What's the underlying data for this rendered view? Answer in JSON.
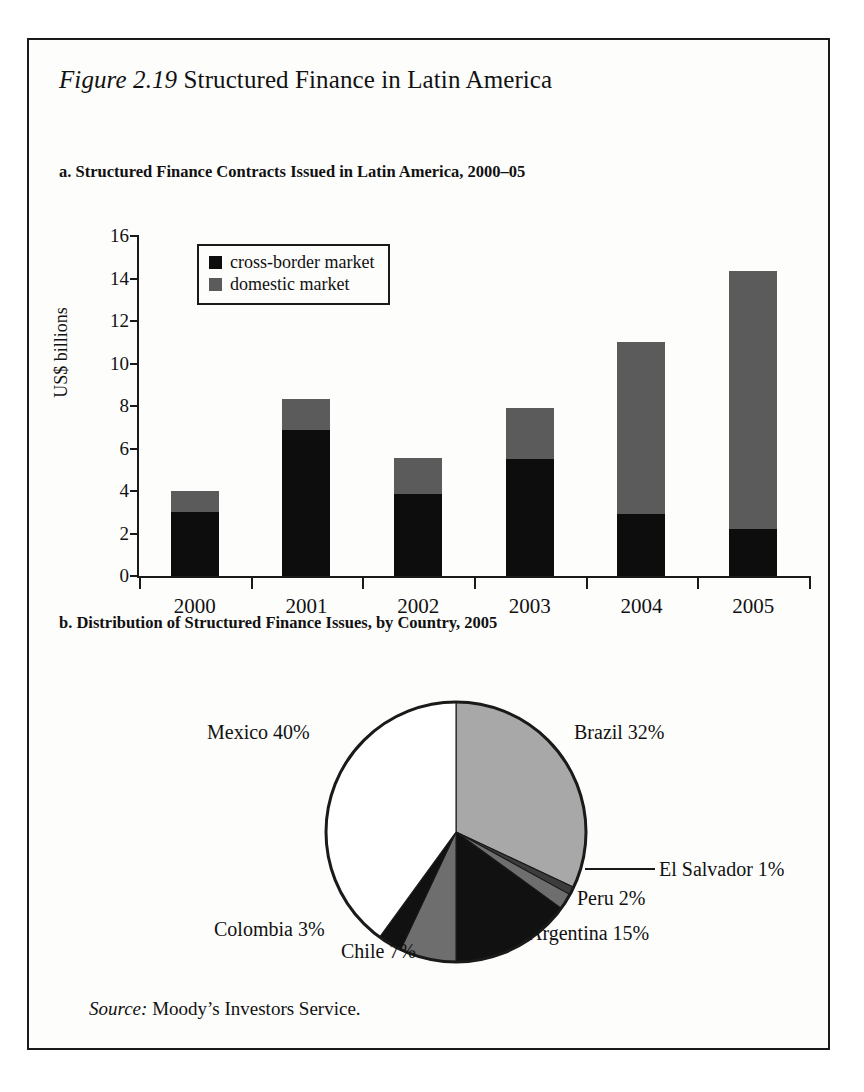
{
  "figure": {
    "label": "Figure 2.19",
    "title": "Structured Finance in Latin America",
    "panel_a_title": "a. Structured Finance Contracts Issued in Latin America, 2000–05",
    "panel_b_title": "b. Distribution of Structured Finance Issues, by Country, 2005",
    "source_label": "Source:",
    "source_text": "Moody’s Investors Service."
  },
  "colors": {
    "cross_border": "#0d0d0d",
    "domestic": "#5b5b5b",
    "pie_brazil": "#a8a8a8",
    "pie_el_salvador": "#3c3c3c",
    "pie_peru": "#6e6e6e",
    "pie_argentina": "#111111",
    "pie_chile": "#6e6e6e",
    "pie_colombia": "#111111",
    "pie_mexico": "#ffffff",
    "outline": "#1a1a1a",
    "background": "#fdfdfc"
  },
  "chart_data": [
    {
      "type": "bar",
      "subtype": "stacked-vertical",
      "title": "a. Structured Finance Contracts Issued in Latin America, 2000–05",
      "xlabel": "",
      "ylabel": "US$ billions",
      "ylim": [
        0,
        16
      ],
      "ytick_step": 2,
      "yticks": [
        0,
        2,
        4,
        6,
        8,
        10,
        12,
        14,
        16
      ],
      "ytick_labels": [
        "0",
        "2",
        "4",
        "6",
        "8",
        "10",
        "12",
        "14",
        "16"
      ],
      "categories": [
        "2000",
        "2001",
        "2002",
        "2003",
        "2004",
        "2005"
      ],
      "grid": false,
      "legend_position": "upper-left-inset",
      "series": [
        {
          "name": "cross-border market",
          "color": "#0d0d0d",
          "values": [
            3.0,
            6.85,
            3.85,
            5.5,
            2.9,
            2.2
          ]
        },
        {
          "name": "domestic market",
          "color": "#5b5b5b",
          "values": [
            1.0,
            1.5,
            1.7,
            2.4,
            8.1,
            12.15
          ]
        }
      ],
      "totals": [
        4.0,
        8.35,
        5.55,
        7.9,
        11.0,
        14.35
      ]
    },
    {
      "type": "pie",
      "title": "b. Distribution of Structured Finance Issues, by Country, 2005",
      "start_angle_deg": 0,
      "direction": "clockwise",
      "unit": "%",
      "slices": [
        {
          "label": "Brazil 32%",
          "name": "Brazil",
          "value": 32,
          "color": "#a8a8a8"
        },
        {
          "label": "El Salvador 1%",
          "name": "El Salvador",
          "value": 1,
          "color": "#3c3c3c"
        },
        {
          "label": "Peru 2%",
          "name": "Peru",
          "value": 2,
          "color": "#6e6e6e"
        },
        {
          "label": "Argentina 15%",
          "name": "Argentina",
          "value": 15,
          "color": "#111111"
        },
        {
          "label": "Chile 7%",
          "name": "Chile",
          "value": 7,
          "color": "#6e6e6e"
        },
        {
          "label": "Colombia 3%",
          "name": "Colombia",
          "value": 3,
          "color": "#111111"
        },
        {
          "label": "Mexico 40%",
          "name": "Mexico",
          "value": 40,
          "color": "#ffffff"
        }
      ]
    }
  ],
  "legend": {
    "items": [
      {
        "label": "cross-border market",
        "color": "#0d0d0d"
      },
      {
        "label": "domestic market",
        "color": "#5b5b5b"
      }
    ]
  }
}
